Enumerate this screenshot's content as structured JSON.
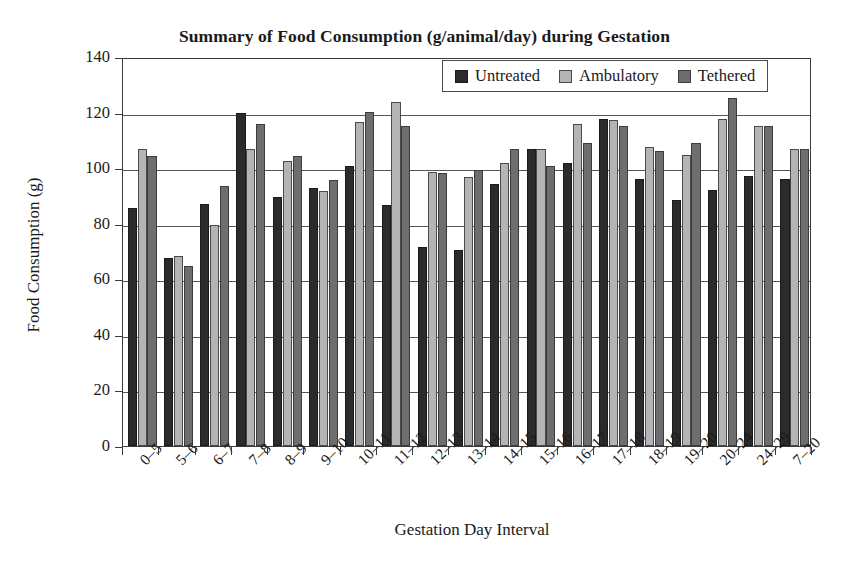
{
  "chart_data": {
    "type": "bar",
    "title": "Summary of Food Consumption (g/animal/day) during Gestation",
    "xlabel": "Gestation Day Interval",
    "ylabel": "Food Consumption (g)",
    "ylim": [
      0,
      140
    ],
    "ytick_labels": [
      "140",
      "120",
      "100",
      "80",
      "60",
      "40",
      "20",
      "0"
    ],
    "ytick_values": [
      140,
      120,
      100,
      80,
      60,
      40,
      20,
      0
    ],
    "grid": "horizontal",
    "legend_position": "top-right-inside",
    "categories": [
      "0–5",
      "5–6",
      "6–7",
      "7–8",
      "8–9",
      "9–10",
      "10–11",
      "11–12",
      "12–13",
      "13–14",
      "14–15",
      "15–16",
      "16–17",
      "17–18",
      "18–19",
      "19–20",
      "20–24",
      "24–29",
      "7–20"
    ],
    "series": [
      {
        "name": "Untreated",
        "color": "#2b2b2b",
        "values": [
          85,
          67,
          86.5,
          119,
          89,
          92,
          100,
          86,
          71,
          70,
          93.5,
          106,
          101,
          117,
          95.5,
          88,
          91.5,
          96.5,
          95.5
        ]
      },
      {
        "name": "Ambulatory",
        "color": "#b4b4b4",
        "values": [
          106,
          67.5,
          79,
          106,
          102,
          91,
          116,
          123,
          98,
          96,
          101,
          106,
          115,
          116.5,
          107,
          104,
          117,
          114.5,
          106
        ]
      },
      {
        "name": "Tethered",
        "color": "#6e6e6e",
        "values": [
          103.5,
          64,
          93,
          115,
          103.5,
          95,
          119.5,
          114.5,
          97.5,
          98.5,
          106,
          100,
          108.5,
          114.5,
          105.5,
          108.5,
          124.5,
          114.5,
          106
        ]
      }
    ]
  },
  "legend": {
    "items": [
      {
        "label": "Untreated",
        "key": "untreated"
      },
      {
        "label": "Ambulatory",
        "key": "ambulatory"
      },
      {
        "label": "Tethered",
        "key": "tethered"
      }
    ]
  }
}
